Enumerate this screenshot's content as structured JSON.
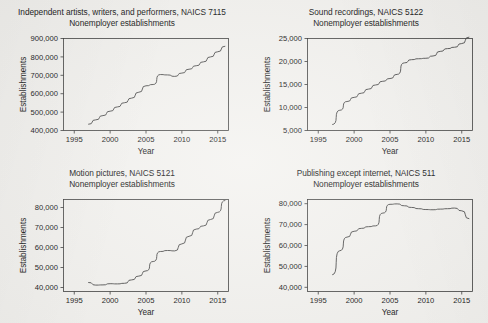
{
  "figure": {
    "kind": "multi-panel-line-chart-figure",
    "panel_count": 4,
    "background_color": "#f4f3f0",
    "line_color": "#4a4a4a",
    "axis_color": "#3a3a3a"
  },
  "chart_data": [
    {
      "type": "line",
      "panel": "top-left",
      "title": "Independent artists, writers, and performers, NAICS 7115",
      "subtitle": "Nonemployer establishments",
      "xlabel": "Year",
      "ylabel": "Establishments",
      "xlim": [
        1993.5,
        2016.5
      ],
      "ylim": [
        400000,
        900000
      ],
      "xticks": [
        1995,
        2000,
        2005,
        2010,
        2015
      ],
      "xticklabels": [
        "1995",
        "2000",
        "2005",
        "2010",
        "2015"
      ],
      "yticks": [
        400000,
        500000,
        600000,
        700000,
        800000,
        900000
      ],
      "yticklabels": [
        "400,000",
        "500,000",
        "600,000",
        "700,000",
        "800,000",
        "900,000"
      ],
      "grid": false,
      "legend": false,
      "x": [
        1997,
        1998,
        1999,
        2000,
        2001,
        2002,
        2003,
        2004,
        2005,
        2006,
        2007,
        2008,
        2009,
        2010,
        2011,
        2012,
        2013,
        2014,
        2015
      ],
      "values": [
        434000,
        458000,
        481000,
        505000,
        528000,
        551000,
        576000,
        608000,
        643000,
        650000,
        704000,
        702000,
        694000,
        712000,
        733000,
        752000,
        773000,
        800000,
        828000,
        858000
      ]
    },
    {
      "type": "line",
      "panel": "top-right",
      "title": "Sound recordings, NAICS 5122",
      "subtitle": "Nonemployer establishments",
      "xlabel": "Year",
      "ylabel": "Establishments",
      "xlim": [
        1993.5,
        2016.5
      ],
      "ylim": [
        5000,
        25000
      ],
      "xticks": [
        1995,
        2000,
        2005,
        2010,
        2015
      ],
      "xticklabels": [
        "1995",
        "2000",
        "2005",
        "2010",
        "2015"
      ],
      "yticks": [
        5000,
        10000,
        15000,
        20000,
        25000
      ],
      "yticklabels": [
        "5,000",
        "10,000",
        "15,000",
        "20,000",
        "25,000"
      ],
      "grid": false,
      "legend": false,
      "x": [
        1997,
        1998,
        1999,
        2000,
        2001,
        2002,
        2003,
        2004,
        2005,
        2006,
        2007,
        2008,
        2009,
        2010,
        2011,
        2012,
        2013,
        2014,
        2015
      ],
      "values": [
        6300,
        9400,
        11300,
        12200,
        13100,
        14000,
        14900,
        15700,
        16300,
        17200,
        19700,
        20400,
        20600,
        20700,
        21200,
        22200,
        22800,
        23100,
        23900,
        25300
      ]
    },
    {
      "type": "line",
      "panel": "bottom-left",
      "title": "Motion pictures, NAICS 5121",
      "subtitle": "Nonemployer establishments",
      "xlabel": "Year",
      "ylabel": "Establishments",
      "xlim": [
        1993.5,
        2016.5
      ],
      "ylim": [
        38000,
        84000
      ],
      "xticks": [
        1995,
        2000,
        2005,
        2010,
        2015
      ],
      "xticklabels": [
        "1995",
        "2000",
        "2005",
        "2010",
        "2015"
      ],
      "yticks": [
        40000,
        50000,
        60000,
        70000,
        80000
      ],
      "yticklabels": [
        "40,000",
        "50,000",
        "60,000",
        "70,000",
        "80,000"
      ],
      "grid": false,
      "legend": false,
      "x": [
        1997,
        1998,
        1999,
        2000,
        2001,
        2002,
        2003,
        2004,
        2005,
        2006,
        2007,
        2008,
        2009,
        2010,
        2011,
        2012,
        2013,
        2014,
        2015
      ],
      "values": [
        42500,
        41200,
        41300,
        41900,
        41800,
        42100,
        43800,
        45700,
        48300,
        53000,
        58000,
        58500,
        58300,
        61800,
        65600,
        69200,
        70800,
        74000,
        77600,
        83500
      ]
    },
    {
      "type": "line",
      "panel": "bottom-right",
      "title": "Publishing except internet, NAICS 511",
      "subtitle": "Nonemployer establishments",
      "xlabel": "Year",
      "ylabel": "Establishments",
      "xlim": [
        1993.5,
        2016.5
      ],
      "ylim": [
        38000,
        82000
      ],
      "xticks": [
        1995,
        2000,
        2005,
        2010,
        2015
      ],
      "xticklabels": [
        "1995",
        "2000",
        "2005",
        "2010",
        "2015"
      ],
      "yticks": [
        40000,
        50000,
        60000,
        70000,
        80000
      ],
      "yticklabels": [
        "40,000",
        "50,000",
        "60,000",
        "70,000",
        "80,000"
      ],
      "grid": false,
      "legend": false,
      "x": [
        1997,
        1998,
        1999,
        2000,
        2001,
        2002,
        2003,
        2004,
        2005,
        2006,
        2007,
        2008,
        2009,
        2010,
        2011,
        2012,
        2013,
        2014,
        2015
      ],
      "values": [
        46000,
        57500,
        64000,
        66800,
        68200,
        69000,
        69400,
        75500,
        79700,
        79900,
        79000,
        78200,
        77600,
        77200,
        77100,
        77400,
        77600,
        77900,
        76600,
        72800
      ]
    }
  ]
}
